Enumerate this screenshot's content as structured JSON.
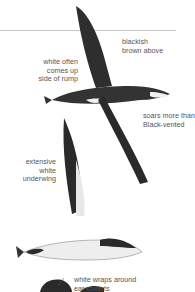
{
  "figure": {
    "annotations": [
      {
        "id": "blackish",
        "text": "blackish\nbrown above"
      },
      {
        "id": "white-rump",
        "text": "white often\ncomes up\nside of rump"
      },
      {
        "id": "soars",
        "text": "soars more than\nBlack-vented"
      },
      {
        "id": "underwing",
        "text": "extensive\nwhite\nunderwing"
      },
      {
        "id": "ear-coverts",
        "text": "white wraps around\near coverts"
      }
    ],
    "colors": {
      "background": "#ffffff",
      "text": "#555555",
      "rule": "#c8c8c8",
      "plumage_dark": "#2a2a2a",
      "plumage_white": "#f2f2f2"
    }
  }
}
